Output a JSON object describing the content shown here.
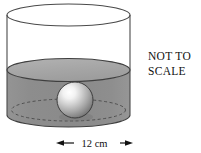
{
  "figure": {
    "name": "sphere-submerged-in-cylinder-of-liquid",
    "title": "",
    "annotations": {
      "not_to_scale_line1": "NOT TO",
      "not_to_scale_line2": "SCALE"
    },
    "dimension_label": {
      "value": "12",
      "unit": "cm",
      "full": "12 cm",
      "measures": "cylinder-diameter"
    },
    "colors": {
      "outline": "#3a3a3a",
      "liquid_body": "#8c8c8c",
      "liquid_surface": "#a8a8a8",
      "cylinder_empty": "#ffffff",
      "sphere_highlight": "#ffffff",
      "sphere_mid": "#b5b5b5",
      "sphere_shadow": "#6e6e6e",
      "text": "#111111",
      "background": "#ffffff"
    },
    "shapes": {
      "cylinder": {
        "label": "cylinder",
        "left_x": 7,
        "right_x": 130,
        "top_ellipse_cy": 15,
        "top_ellipse_ry": 11,
        "bottom_ellipse_cy": 115,
        "bottom_ellipse_ry": 12
      },
      "liquid_surface": {
        "label": "liquid-surface-ellipse",
        "cy": 70,
        "ry": 11.5
      },
      "sphere": {
        "label": "sphere",
        "cx": 75,
        "cy": 100,
        "r": 18
      },
      "hidden_base_ellipse": {
        "label": "dashed-back-base-ellipse",
        "cy": 110,
        "ry": 11,
        "dash": "3 2.5"
      }
    }
  }
}
